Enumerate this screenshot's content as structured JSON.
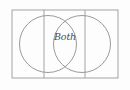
{
  "diagram": {
    "type": "venn-two-set",
    "background_color": "#fdfdfd",
    "stroke_color": "#9a9a9a",
    "circle_stroke_color": "#8e8e8e",
    "label_color": "#4a4a4a",
    "labels": {
      "intersection": "Both",
      "left_region": "",
      "right_region": ""
    },
    "frame": {
      "name": "outer-rectangle",
      "x": 12,
      "y": 10,
      "width": 106,
      "height": 68
    },
    "dividers": [
      {
        "name": "left-divider",
        "x": 44,
        "y1": 10,
        "y2": 78
      },
      {
        "name": "right-divider",
        "x": 85,
        "y1": 10,
        "y2": 78
      }
    ],
    "circles": [
      {
        "name": "left-circle",
        "cx": 48,
        "cy": 44,
        "r": 28.5
      },
      {
        "name": "right-circle",
        "cx": 82,
        "cy": 44,
        "r": 28.5
      }
    ],
    "intersection_points": [
      {
        "x": 65,
        "y": 18
      },
      {
        "x": 65,
        "y": 70
      }
    ]
  }
}
